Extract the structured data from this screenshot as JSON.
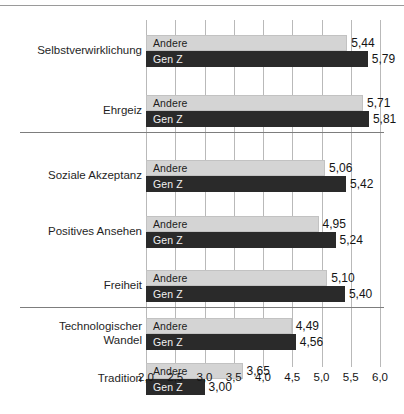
{
  "chart_data": {
    "type": "bar",
    "orientation": "horizontal",
    "title": "",
    "xlabel": "",
    "ylabel": "",
    "xlim": [
      2.0,
      6.0
    ],
    "xticks": [
      "2,0",
      "2,5",
      "3,0",
      "3,5",
      "4,0",
      "4,5",
      "5,0",
      "5,5",
      "6,0"
    ],
    "xtick_values": [
      2.0,
      2.5,
      3.0,
      3.5,
      4.0,
      4.5,
      5.0,
      5.5,
      6.0
    ],
    "grid": true,
    "legend_position": "in-bar",
    "series": [
      {
        "name": "Andere",
        "values": [
          5.44,
          5.71,
          5.06,
          4.95,
          5.1,
          4.49,
          3.65
        ],
        "labels": [
          "5,44",
          "5,71",
          "5,06",
          "4,95",
          "5,10",
          "4,49",
          "3,65"
        ],
        "color": "#d4d4d4"
      },
      {
        "name": "Gen Z",
        "values": [
          5.79,
          5.81,
          5.42,
          5.24,
          5.4,
          4.56,
          3.0
        ],
        "labels": [
          "5,79",
          "5,81",
          "5,42",
          "5,24",
          "5,40",
          "4,56",
          "3,00"
        ],
        "color": "#2a2a2a"
      }
    ],
    "categories": [
      "Selbstverwirklichung",
      "Ehrgeiz",
      "Soziale Akzeptanz",
      "Positives Ansehen",
      "Freiheit",
      "Technologischer\nWandel",
      "Tradition"
    ],
    "groups": [
      {
        "name": "group-1",
        "categories": [
          "Selbstverwirklichung",
          "Ehrgeiz"
        ]
      },
      {
        "name": "group-2",
        "categories": [
          "Soziale Akzeptanz",
          "Positives Ansehen",
          "Freiheit"
        ]
      },
      {
        "name": "group-3",
        "categories": [
          "Technologischer Wandel",
          "Tradition"
        ]
      }
    ]
  },
  "caption": "",
  "colors": {
    "andere": "#d4d4d4",
    "genz": "#2a2a2a",
    "grid": "#b9b9b9",
    "separator": "#7d7d7d",
    "text": "#141414"
  }
}
